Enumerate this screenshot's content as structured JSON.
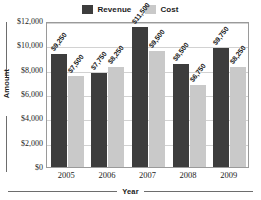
{
  "chart_data": {
    "type": "bar",
    "title": "",
    "xlabel": "Year",
    "ylabel": "Amount",
    "categories": [
      "2005",
      "2006",
      "2007",
      "2008",
      "2009"
    ],
    "series": [
      {
        "name": "Revenue",
        "color": "#3d3d3d",
        "values": [
          9250,
          7750,
          11500,
          8500,
          9750
        ],
        "labels": [
          "$9,250",
          "$7,750",
          "$11,500",
          "$8,500",
          "$9,750"
        ]
      },
      {
        "name": "Cost",
        "color": "#c9c9c9",
        "values": [
          7500,
          8250,
          9500,
          6750,
          8250
        ],
        "labels": [
          "$7,500",
          "$8,250",
          "$9,500",
          "$6,750",
          "$8,250"
        ]
      }
    ],
    "ylim": [
      0,
      12000
    ],
    "yticks": [
      0,
      2000,
      4000,
      6000,
      8000,
      10000,
      12000
    ],
    "ytick_labels": [
      "$0",
      "$2,000",
      "$4,000",
      "$6,000",
      "$8,000",
      "$10,000",
      "$12,000"
    ],
    "grid": "horizontal",
    "legend_position": "top-center"
  },
  "legend": {
    "entries": [
      {
        "label": "Revenue",
        "color": "#3d3d3d"
      },
      {
        "label": "Cost",
        "color": "#c9c9c9"
      }
    ]
  }
}
